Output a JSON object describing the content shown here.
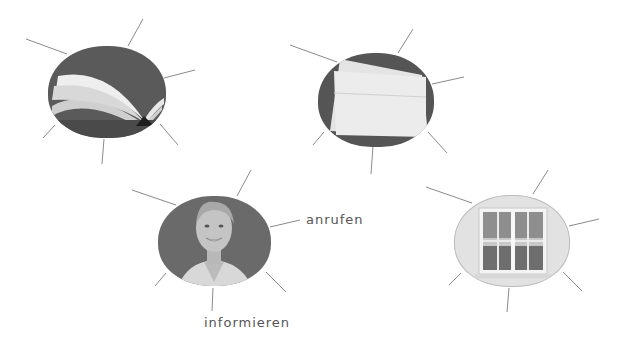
{
  "diagram": {
    "type": "word-web exercise",
    "nodes": [
      {
        "id": "book",
        "image": "open-book photo",
        "labels": []
      },
      {
        "id": "envelope",
        "image": "envelope photo",
        "labels": []
      },
      {
        "id": "woman",
        "image": "smiling woman portrait",
        "labels": [
          "anrufen",
          "informieren"
        ]
      },
      {
        "id": "window",
        "image": "window photo",
        "labels": []
      }
    ],
    "labels": {
      "anrufen": "anrufen",
      "informieren": "informieren"
    },
    "colors": {
      "line": "#8a8a8a",
      "text": "#555555",
      "dark_bg": "#555555"
    }
  }
}
